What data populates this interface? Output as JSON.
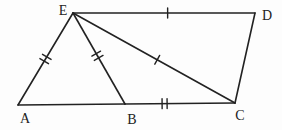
{
  "figure": {
    "kind": "geometry-diagram",
    "background": "#fdfdfd",
    "stroke_color": "#222222",
    "label_font_size": 14,
    "points": {
      "A": {
        "label": "A",
        "x": 18,
        "y": 105,
        "label_x": 25,
        "label_y": 123
      },
      "B": {
        "label": "B",
        "x": 125,
        "y": 104,
        "label_x": 132,
        "label_y": 124
      },
      "C": {
        "label": "C",
        "x": 235,
        "y": 103,
        "label_x": 240,
        "label_y": 120
      },
      "D": {
        "label": "D",
        "x": 255,
        "y": 13,
        "label_x": 267,
        "label_y": 20
      },
      "E": {
        "label": "E",
        "x": 73,
        "y": 13,
        "label_x": 63,
        "label_y": 15
      }
    },
    "segments": [
      {
        "name": "AE",
        "from": "A",
        "to": "E",
        "ticks": 2,
        "tick_t": 0.5
      },
      {
        "name": "EB",
        "from": "E",
        "to": "B",
        "ticks": 2,
        "tick_t": 0.47
      },
      {
        "name": "ED",
        "from": "E",
        "to": "D",
        "ticks": 1,
        "tick_t": 0.52
      },
      {
        "name": "EC",
        "from": "E",
        "to": "C",
        "ticks": 1,
        "tick_t": 0.52
      },
      {
        "name": "AB",
        "from": "A",
        "to": "B",
        "ticks": 0,
        "tick_t": 0
      },
      {
        "name": "BC",
        "from": "B",
        "to": "C",
        "ticks": 2,
        "tick_t": 0.36
      },
      {
        "name": "DC",
        "from": "D",
        "to": "C",
        "ticks": 0,
        "tick_t": 0
      }
    ],
    "tick_style": {
      "length": 10,
      "gap": 5,
      "stroke_width": 1.4
    },
    "line_width": 1.6
  }
}
